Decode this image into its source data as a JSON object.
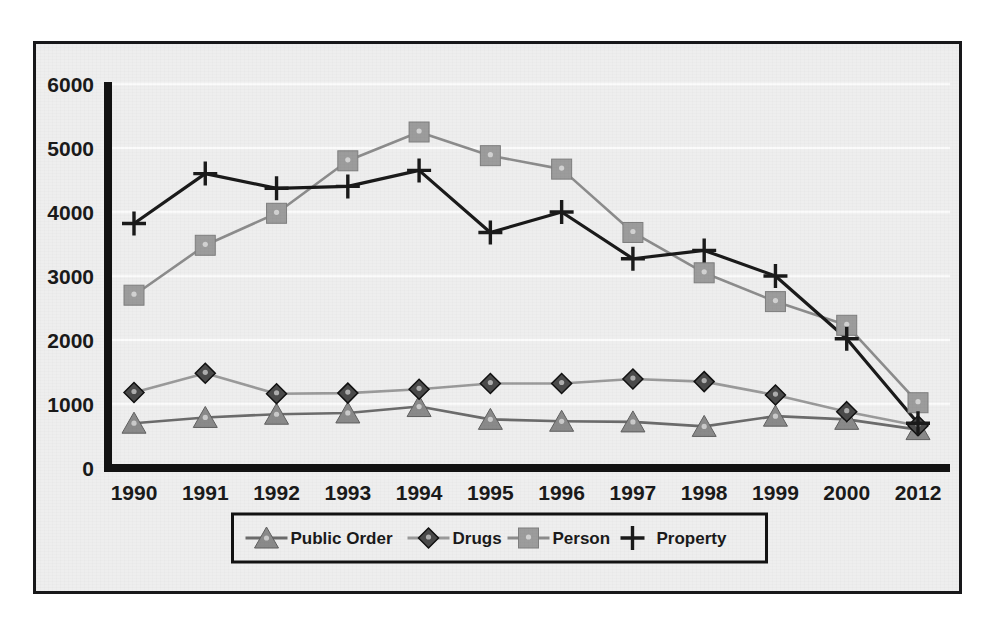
{
  "chart_data": {
    "type": "line",
    "title": "",
    "subtitle": "",
    "xlabel": "",
    "ylabel": "",
    "categories": [
      "1990",
      "1991",
      "1992",
      "1993",
      "1994",
      "1995",
      "1996",
      "1997",
      "1998",
      "1999",
      "2000",
      "2012"
    ],
    "x_tick_labels": [
      "1990",
      "1991",
      "1992",
      "1993",
      "1994",
      "1995",
      "1996",
      "1997",
      "1998",
      "1999",
      "2000",
      "2012"
    ],
    "y_tick_labels": [
      "0",
      "1000",
      "2000",
      "3000",
      "4000",
      "5000",
      "6000"
    ],
    "y_ticks": [
      0,
      1000,
      2000,
      3000,
      4000,
      5000,
      6000
    ],
    "ylim": [
      0,
      6000
    ],
    "grid": true,
    "grid_axis": "y",
    "legend_position": "bottom",
    "series": [
      {
        "name": "Public Order",
        "marker": "triangle",
        "color": "#8a8a8a",
        "line_color": "#6b6b6b",
        "values": [
          700,
          790,
          840,
          860,
          960,
          760,
          730,
          720,
          650,
          810,
          760,
          600
        ]
      },
      {
        "name": "Drugs",
        "marker": "diamond",
        "color": "#4a4a4a",
        "line_color": "#9a9a9a",
        "values": [
          1180,
          1480,
          1160,
          1170,
          1230,
          1320,
          1320,
          1390,
          1350,
          1140,
          880,
          660
        ]
      },
      {
        "name": "Person",
        "marker": "square",
        "color": "#9c9c9c",
        "line_color": "#8c8c8c",
        "values": [
          2700,
          3480,
          3980,
          4800,
          5250,
          4880,
          4670,
          3680,
          3050,
          2600,
          2230,
          1020
        ]
      },
      {
        "name": "Property",
        "marker": "plus",
        "color": "#1a1a1a",
        "line_color": "#1a1a1a",
        "values": [
          3820,
          4600,
          4370,
          4400,
          4650,
          3680,
          4000,
          3270,
          3400,
          3000,
          2020,
          700
        ]
      }
    ]
  },
  "legend": {
    "entries": [
      {
        "label": "Public Order",
        "marker": "triangle"
      },
      {
        "label": "Drugs",
        "marker": "diamond"
      },
      {
        "label": "Person",
        "marker": "square"
      },
      {
        "label": "Property",
        "marker": "plus"
      }
    ]
  },
  "colors": {
    "background": "#eeeeee",
    "border": "#18181a",
    "axis": "#121212",
    "gridline": "#fbfbfb",
    "text": "#1a1a1a"
  }
}
